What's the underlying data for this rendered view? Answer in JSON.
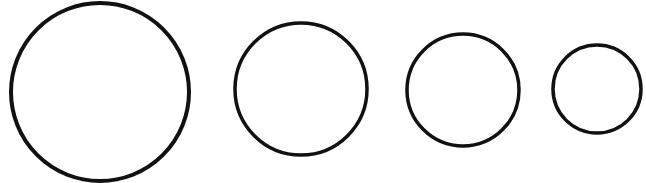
{
  "diagram": {
    "background": "#ffffff",
    "stroke_color": "#111111",
    "circles": [
      {
        "cx": 100,
        "cy": 92,
        "r": 89,
        "stroke_width": 4
      },
      {
        "cx": 301,
        "cy": 89,
        "r": 66,
        "stroke_width": 3.5
      },
      {
        "cx": 463,
        "cy": 90,
        "r": 56,
        "stroke_width": 3.5
      },
      {
        "cx": 597,
        "cy": 89,
        "r": 44,
        "stroke_width": 3.5
      }
    ]
  }
}
